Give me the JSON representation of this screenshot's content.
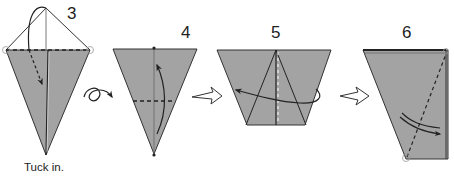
{
  "diagram": {
    "steps": [
      {
        "number": "3",
        "caption": "Tuck in."
      },
      {
        "number": "4"
      },
      {
        "number": "5"
      },
      {
        "number": "6"
      }
    ],
    "symbols": {
      "turn_over": "turn-over-icon",
      "next_step_arrow": "hollow-arrow-icon",
      "fold_arrow": "curved-arrow-icon"
    },
    "colors": {
      "paper_fill": "#a3a3a3",
      "line": "#222222",
      "background": "#ffffff"
    }
  }
}
